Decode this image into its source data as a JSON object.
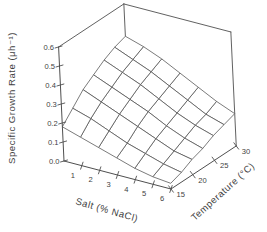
{
  "figure": {
    "background": "#ffffff",
    "line_color": "#4f4f4f",
    "surface_fill": "#ffffff",
    "text_color": "#3f3f3f"
  },
  "chart_data": {
    "type": "surface",
    "title": "",
    "xlabel": "Salt (% NaCl)",
    "ylabel": "Temperature (°C)",
    "zlabel": "Specific Growth Rate (μh⁻¹)",
    "x_salt_percent": [
      0,
      1,
      2,
      3,
      4,
      5,
      6
    ],
    "y_temperature_c": [
      15,
      17.5,
      20,
      22.5,
      25,
      27.5,
      30
    ],
    "x_tick_labels": [
      "1",
      "2",
      "3",
      "4",
      "5",
      "6"
    ],
    "x_tick_values": [
      1,
      2,
      3,
      4,
      5,
      6
    ],
    "y_tick_labels": [
      "15",
      "20",
      "25",
      "30"
    ],
    "y_tick_values": [
      15,
      20,
      25,
      30
    ],
    "z_tick_labels": [
      "0.0",
      "0.1",
      "0.2",
      "0.3",
      "0.4",
      "0.5",
      "0.6"
    ],
    "z_tick_values": [
      0.0,
      0.1,
      0.2,
      0.3,
      0.4,
      0.5,
      0.6
    ],
    "zlim": [
      0,
      0.6
    ],
    "legend": "none",
    "grid": "wireframe-mesh",
    "z_values_rows_are_temperature": true,
    "z_values": [
      [
        0.18,
        0.15,
        0.12,
        0.09,
        0.06,
        0.04,
        0.03
      ],
      [
        0.24,
        0.21,
        0.17,
        0.13,
        0.1,
        0.07,
        0.05
      ],
      [
        0.3,
        0.26,
        0.22,
        0.18,
        0.14,
        0.1,
        0.08
      ],
      [
        0.34,
        0.3,
        0.26,
        0.22,
        0.17,
        0.13,
        0.1
      ],
      [
        0.38,
        0.34,
        0.3,
        0.25,
        0.2,
        0.16,
        0.13
      ],
      [
        0.41,
        0.37,
        0.33,
        0.28,
        0.23,
        0.18,
        0.15
      ],
      [
        0.43,
        0.4,
        0.36,
        0.31,
        0.26,
        0.21,
        0.17
      ]
    ]
  }
}
